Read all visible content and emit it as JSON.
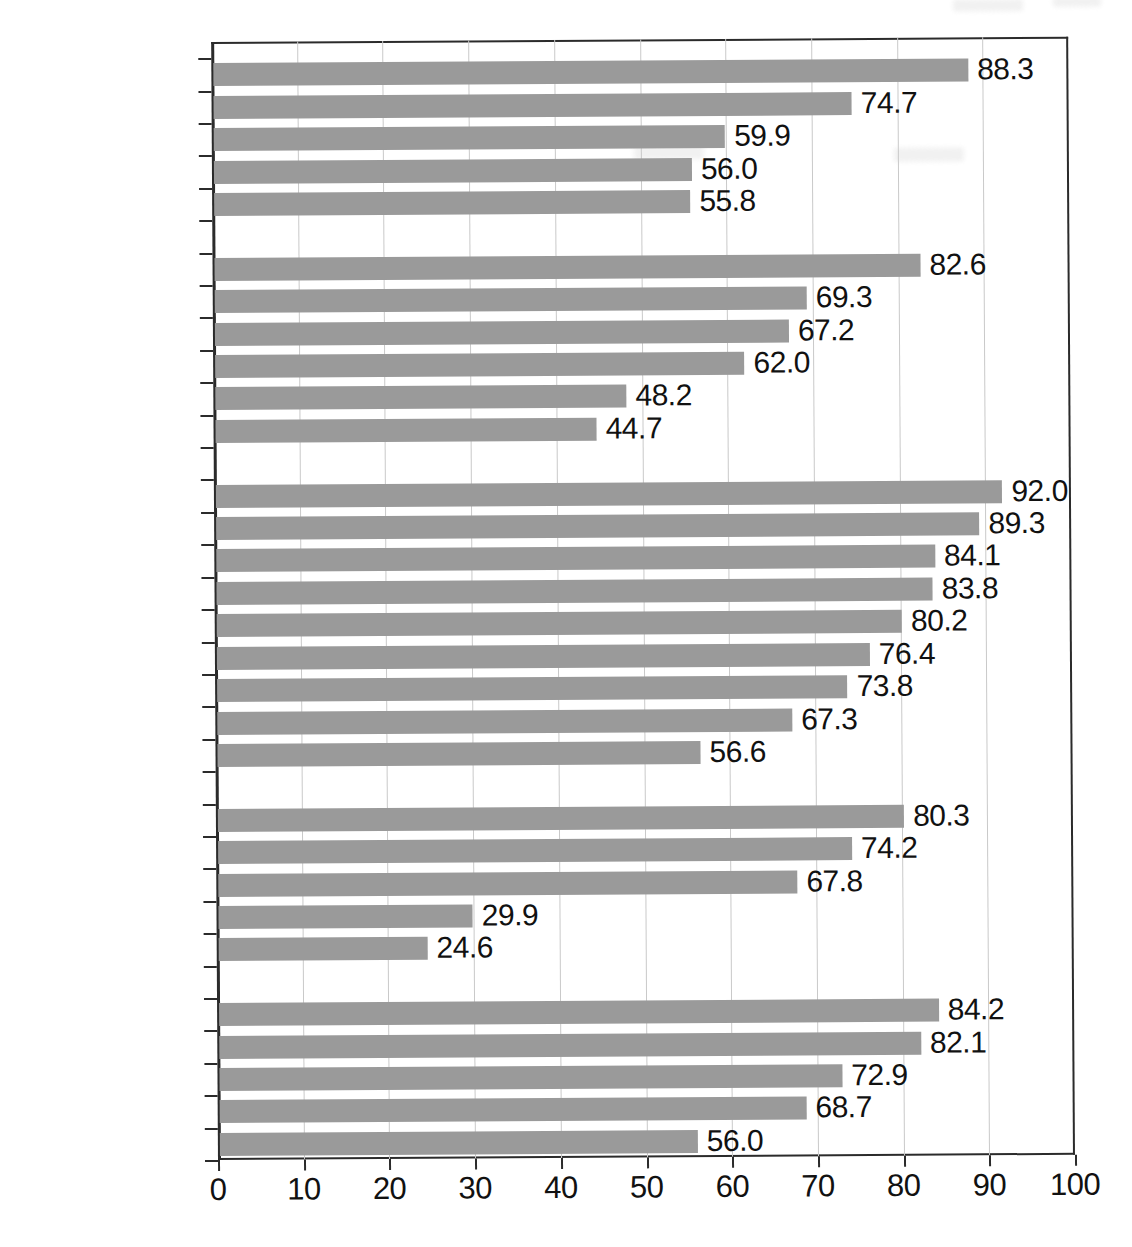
{
  "chart_data": {
    "type": "bar",
    "orientation": "horizontal",
    "title": "",
    "subtitle": "",
    "xlabel": "",
    "ylabel": "",
    "xlim": [
      0,
      100
    ],
    "xticks": [
      0,
      10,
      20,
      30,
      40,
      50,
      60,
      70,
      80,
      90,
      100
    ],
    "xticklabels": [
      "0",
      "10",
      "20",
      "30",
      "40",
      "50",
      "60",
      "70",
      "80",
      "90",
      "100"
    ],
    "grid": "vertical",
    "legend": "none",
    "bar_color": "#9a9a9a",
    "label_color": "#121212",
    "highlight_label_color": "#b0b0b0",
    "value_label_format": "one-decimal",
    "groups": [
      {
        "name": "group-1",
        "categories": [
          "Angola",
          "South Africa",
          "Guinea",
          "Niger",
          "Gambia"
        ],
        "values": [
          88.3,
          74.7,
          59.9,
          56.0,
          55.8
        ]
      },
      {
        "name": "group-2",
        "categories": [
          "Canada",
          "Argentina",
          "Venezuela",
          "Nicaragua",
          "Brazil",
          "United States"
        ],
        "values": [
          82.6,
          69.3,
          67.2,
          62.0,
          48.2,
          44.7
        ]
      },
      {
        "name": "group-3",
        "categories": [
          "Italy",
          "Iceland",
          "Sweden",
          "Netherlands",
          "Germany",
          "Spain",
          "United Kingdom",
          "France",
          "Russia"
        ],
        "values": [
          92.0,
          89.3,
          84.1,
          83.8,
          80.2,
          76.4,
          73.8,
          67.3,
          56.6
        ]
      },
      {
        "name": "group-4",
        "categories": [
          "Israel",
          "Turkey",
          "Lebanon",
          "Jordan",
          "Egypt"
        ],
        "values": [
          80.3,
          74.2,
          67.8,
          29.9,
          24.6
        ]
      },
      {
        "name": "group-5",
        "categories": [
          "Australia",
          "Thailand",
          "South Korea",
          "Japan",
          "Bangladesh"
        ],
        "values": [
          84.2,
          82.1,
          72.9,
          68.7,
          56.0
        ]
      }
    ],
    "categories": [
      "Angola",
      "South Africa",
      "Guinea",
      "Niger",
      "Gambia",
      "Canada",
      "Argentina",
      "Venezuela",
      "Nicaragua",
      "Brazil",
      "United States",
      "Italy",
      "Iceland",
      "Sweden",
      "Netherlands",
      "Germany",
      "Spain",
      "United Kingdom",
      "France",
      "Russia",
      "Israel",
      "Turkey",
      "Lebanon",
      "Jordan",
      "Egypt",
      "Australia",
      "Thailand",
      "South Korea",
      "Japan",
      "Bangladesh"
    ],
    "values": [
      88.3,
      74.7,
      59.9,
      56.0,
      55.8,
      82.6,
      69.3,
      67.2,
      62.0,
      48.2,
      44.7,
      92.0,
      89.3,
      84.1,
      83.8,
      80.2,
      76.4,
      73.8,
      67.3,
      56.6,
      80.3,
      74.2,
      67.8,
      29.9,
      24.6,
      84.2,
      82.1,
      72.9,
      68.7,
      56.0
    ],
    "highlighted_categories": [
      "United States"
    ]
  }
}
